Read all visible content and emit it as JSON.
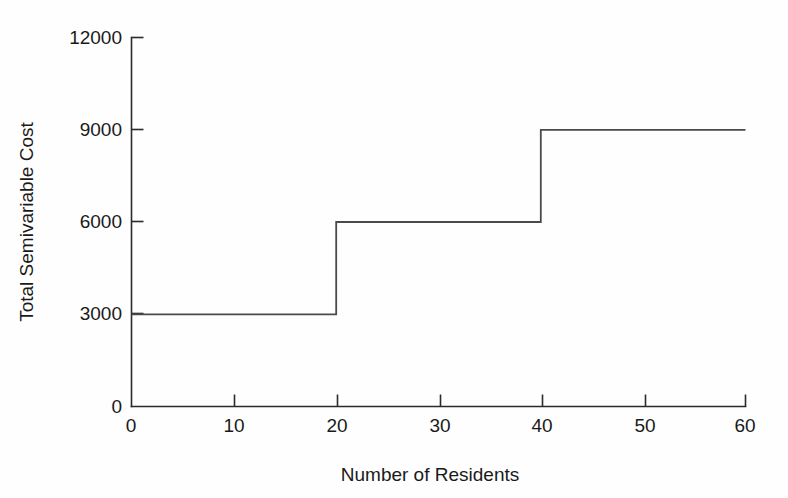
{
  "chart_data": {
    "type": "line",
    "subtype": "step",
    "title": "",
    "xlabel": "Number of Residents",
    "ylabel": "Total Semivariable Cost",
    "xlim": [
      0,
      60
    ],
    "ylim": [
      0,
      12000
    ],
    "xticks": [
      0,
      10,
      20,
      30,
      40,
      50,
      60
    ],
    "xtick_labels": [
      "0",
      "10",
      "20",
      "30",
      "40",
      "50",
      "60"
    ],
    "yticks": [
      0,
      3000,
      6000,
      9000,
      12000
    ],
    "ytick_labels": [
      "0",
      "3000",
      "6000",
      "9000",
      "12000"
    ],
    "grid": false,
    "legend": null,
    "series": [
      {
        "name": "Total Semivariable Cost",
        "step_segments": [
          {
            "x_start": 0,
            "x_end": 20,
            "y": 3000
          },
          {
            "x_start": 20,
            "x_end": 40,
            "y": 6000
          },
          {
            "x_start": 40,
            "x_end": 60,
            "y": 9000
          }
        ],
        "points": [
          {
            "x": 0,
            "y": 3000
          },
          {
            "x": 20,
            "y": 3000
          },
          {
            "x": 20,
            "y": 6000
          },
          {
            "x": 40,
            "y": 6000
          },
          {
            "x": 40,
            "y": 9000
          },
          {
            "x": 60,
            "y": 9000
          }
        ],
        "color": "#4a4a4a"
      }
    ],
    "annotations": []
  },
  "style": {
    "background": "#fefefe",
    "axis_color": "#2b2b2b",
    "line_color": "#4a4a4a",
    "text_color": "#1a1a1a"
  }
}
